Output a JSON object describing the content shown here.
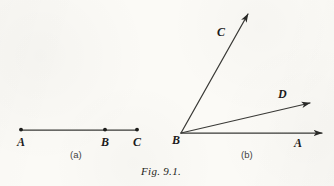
{
  "figure": {
    "caption": "Fig. 9.1.",
    "caption_pos": {
      "x": 141,
      "y": 166
    },
    "background_color": "#fbfaf6",
    "ink_color": "#2a2a28",
    "label_color": "#1b1b1b"
  },
  "panels": [
    {
      "id": "a",
      "sublabel": "(a)",
      "sublabel_pos": {
        "x": 70,
        "y": 150
      },
      "type": "line-segment-with-points",
      "segment": {
        "x1": 21,
        "y1": 130,
        "x2": 137,
        "y2": 130
      },
      "points": [
        {
          "name": "A",
          "x": 21,
          "y": 130,
          "label": "A",
          "label_x": 17,
          "label_y": 136
        },
        {
          "name": "B",
          "x": 105,
          "y": 130,
          "label": "B",
          "label_x": 101,
          "label_y": 136
        },
        {
          "name": "C",
          "x": 137,
          "y": 130,
          "label": "C",
          "label_x": 133,
          "label_y": 136
        }
      ]
    },
    {
      "id": "b",
      "sublabel": "(b)",
      "sublabel_pos": {
        "x": 241,
        "y": 150
      },
      "type": "rays-from-vertex",
      "vertex": {
        "name": "B",
        "x": 181,
        "y": 133,
        "label": "B",
        "label_x": 172,
        "label_y": 134
      },
      "rays": [
        {
          "name": "BA",
          "to_label": "A",
          "x2": 322,
          "y2": 133,
          "label_x": 294,
          "label_y": 137
        },
        {
          "name": "BD",
          "to_label": "D",
          "x2": 310,
          "y2": 103,
          "label_x": 278,
          "label_y": 88
        },
        {
          "name": "BC",
          "to_label": "C",
          "x2": 248,
          "y2": 14,
          "label_x": 217,
          "label_y": 26
        }
      ]
    }
  ]
}
